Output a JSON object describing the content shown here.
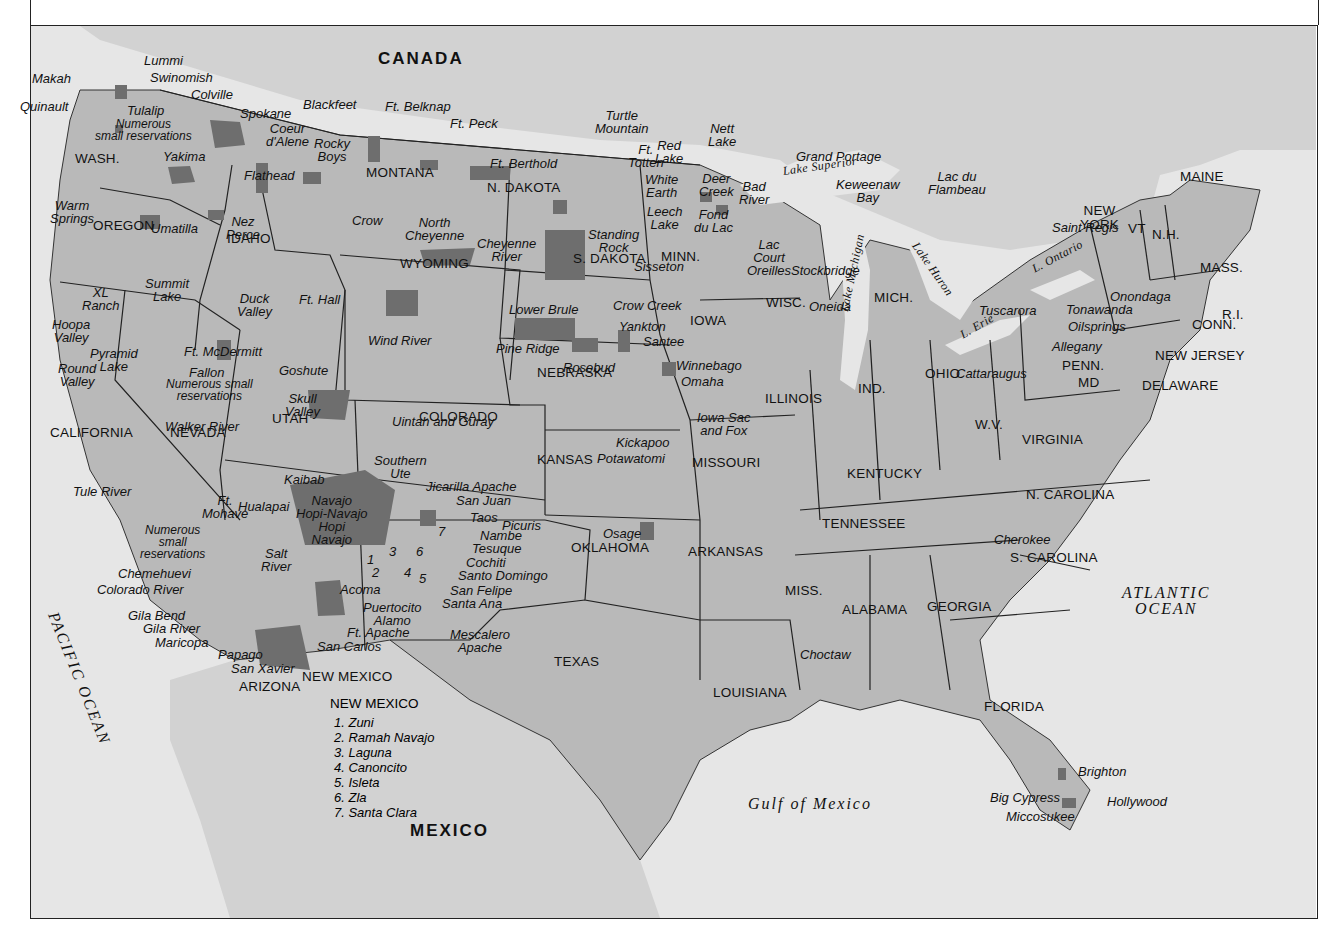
{
  "map": {
    "title": "Indian Reservations of the United States",
    "colors": {
      "water": "#e6e6e6",
      "land_us": "#b9b9b9",
      "land_foreign": "#d2d2d2",
      "reservation": "#6e6e6e",
      "border": "#222222"
    },
    "countries": [
      {
        "id": "canada",
        "label": "CANADA",
        "x": 378,
        "y": 50
      },
      {
        "id": "mexico",
        "label": "MEXICO",
        "x": 410,
        "y": 822
      }
    ],
    "oceans": [
      {
        "id": "pacific",
        "label": "PACIFIC OCEAN",
        "x": 60,
        "y": 610,
        "rotate": 68
      },
      {
        "id": "atlantic",
        "label": "ATLANTIC\nOCEAN",
        "x": 1122,
        "y": 585
      },
      {
        "id": "gulf",
        "label": "Gulf of Mexico",
        "x": 748,
        "y": 796
      }
    ],
    "lakes": [
      {
        "label": "Lake Superior",
        "x": 782,
        "y": 165,
        "rotate": -8
      },
      {
        "label": "Lake Michigan",
        "x": 838,
        "y": 310,
        "rotate": -78
      },
      {
        "label": "Lake Huron",
        "x": 920,
        "y": 240,
        "rotate": 55
      },
      {
        "label": "L. Ontario",
        "x": 1030,
        "y": 264,
        "rotate": -28
      },
      {
        "label": "L. Erie",
        "x": 958,
        "y": 330,
        "rotate": -30
      }
    ],
    "states": [
      {
        "label": "WASH.",
        "x": 75,
        "y": 152
      },
      {
        "label": "OREGON",
        "x": 93,
        "y": 219
      },
      {
        "label": "IDAHO",
        "x": 227,
        "y": 232
      },
      {
        "label": "MONTANA",
        "x": 366,
        "y": 166
      },
      {
        "label": "WYOMING",
        "x": 400,
        "y": 257
      },
      {
        "label": "N. DAKOTA",
        "x": 487,
        "y": 181
      },
      {
        "label": "S. DAKOTA",
        "x": 573,
        "y": 252
      },
      {
        "label": "MINN.",
        "x": 661,
        "y": 250
      },
      {
        "label": "WISC.",
        "x": 766,
        "y": 296
      },
      {
        "label": "MICH.",
        "x": 874,
        "y": 291
      },
      {
        "label": "IOWA",
        "x": 690,
        "y": 314
      },
      {
        "label": "NEBRASKA",
        "x": 537,
        "y": 366
      },
      {
        "label": "NEVADA",
        "x": 170,
        "y": 426
      },
      {
        "label": "CALIFORNIA",
        "x": 50,
        "y": 426
      },
      {
        "label": "UTAH",
        "x": 272,
        "y": 412
      },
      {
        "label": "COLORADO",
        "x": 419,
        "y": 410
      },
      {
        "label": "KANSAS",
        "x": 537,
        "y": 453
      },
      {
        "label": "MISSOURI",
        "x": 692,
        "y": 456
      },
      {
        "label": "ILLINOIS",
        "x": 765,
        "y": 392
      },
      {
        "label": "IND.",
        "x": 858,
        "y": 382
      },
      {
        "label": "OHIO",
        "x": 925,
        "y": 367
      },
      {
        "label": "PENN.",
        "x": 1062,
        "y": 359
      },
      {
        "label": "NEW\nYORK",
        "x": 1080,
        "y": 204
      },
      {
        "label": "VT",
        "x": 1128,
        "y": 222
      },
      {
        "label": "N.H.",
        "x": 1152,
        "y": 228
      },
      {
        "label": "MAINE",
        "x": 1180,
        "y": 170
      },
      {
        "label": "MASS.",
        "x": 1200,
        "y": 261
      },
      {
        "label": "R.I.",
        "x": 1222,
        "y": 308
      },
      {
        "label": "CONN.",
        "x": 1192,
        "y": 318
      },
      {
        "label": "NEW JERSEY",
        "x": 1155,
        "y": 349
      },
      {
        "label": "DELAWARE",
        "x": 1142,
        "y": 379
      },
      {
        "label": "MD",
        "x": 1078,
        "y": 376
      },
      {
        "label": "W.V.",
        "x": 975,
        "y": 418
      },
      {
        "label": "VIRGINIA",
        "x": 1022,
        "y": 433
      },
      {
        "label": "KENTUCKY",
        "x": 847,
        "y": 467
      },
      {
        "label": "TENNESSEE",
        "x": 822,
        "y": 517
      },
      {
        "label": "N. CAROLINA",
        "x": 1026,
        "y": 488
      },
      {
        "label": "S. CAROLINA",
        "x": 1010,
        "y": 551
      },
      {
        "label": "OKLAHOMA",
        "x": 571,
        "y": 541
      },
      {
        "label": "ARKANSAS",
        "x": 688,
        "y": 545
      },
      {
        "label": "MISS.",
        "x": 785,
        "y": 584
      },
      {
        "label": "ALABAMA",
        "x": 842,
        "y": 603
      },
      {
        "label": "GEORGIA",
        "x": 927,
        "y": 600
      },
      {
        "label": "TEXAS",
        "x": 554,
        "y": 655
      },
      {
        "label": "LOUISIANA",
        "x": 713,
        "y": 686
      },
      {
        "label": "FLORIDA",
        "x": 984,
        "y": 700
      },
      {
        "label": "ARIZONA",
        "x": 239,
        "y": 680
      },
      {
        "label": "NEW MEXICO",
        "x": 302,
        "y": 670
      }
    ],
    "reservations": [
      {
        "label": "Lummi",
        "x": 144,
        "y": 54
      },
      {
        "label": "Makah",
        "x": 32,
        "y": 72
      },
      {
        "label": "Swinomish",
        "x": 150,
        "y": 71
      },
      {
        "label": "Quinault",
        "x": 20,
        "y": 100
      },
      {
        "label": "Colville",
        "x": 191,
        "y": 88
      },
      {
        "label": "Tulalip",
        "x": 127,
        "y": 104
      },
      {
        "label": "Numerous\nsmall reservations",
        "x": 95,
        "y": 118,
        "small": true
      },
      {
        "label": "Spokane",
        "x": 240,
        "y": 107
      },
      {
        "label": "Coeur\nd'Alene",
        "x": 266,
        "y": 122
      },
      {
        "label": "Yakima",
        "x": 163,
        "y": 150
      },
      {
        "label": "Blackfeet",
        "x": 303,
        "y": 98
      },
      {
        "label": "Ft. Belknap",
        "x": 385,
        "y": 100
      },
      {
        "label": "Ft. Peck",
        "x": 450,
        "y": 117
      },
      {
        "label": "Rocky\nBoys",
        "x": 314,
        "y": 137
      },
      {
        "label": "Flathead",
        "x": 244,
        "y": 169
      },
      {
        "label": "Warm\nSprings",
        "x": 50,
        "y": 199
      },
      {
        "label": "Umatilla",
        "x": 151,
        "y": 222
      },
      {
        "label": "Nez\nPerce",
        "x": 226,
        "y": 215
      },
      {
        "label": "North\nCheyenne",
        "x": 405,
        "y": 216
      },
      {
        "label": "Crow",
        "x": 352,
        "y": 214
      },
      {
        "label": "Cheyenne\nRiver",
        "x": 477,
        "y": 237
      },
      {
        "label": "Turtle\nMountain",
        "x": 595,
        "y": 109
      },
      {
        "label": "Ft. Berthold",
        "x": 490,
        "y": 157
      },
      {
        "label": "Ft.\nTotten",
        "x": 628,
        "y": 143
      },
      {
        "label": "Red\nLake",
        "x": 655,
        "y": 139
      },
      {
        "label": "Nett\nLake",
        "x": 708,
        "y": 122
      },
      {
        "label": "White\nEarth",
        "x": 645,
        "y": 173
      },
      {
        "label": "Standing\nRock",
        "x": 588,
        "y": 228
      },
      {
        "label": "Sisseton",
        "x": 634,
        "y": 260
      },
      {
        "label": "Leech\nLake",
        "x": 647,
        "y": 205
      },
      {
        "label": "Deer\nCreek",
        "x": 699,
        "y": 172
      },
      {
        "label": "Fond\ndu Lac",
        "x": 694,
        "y": 208
      },
      {
        "label": "Bad\nRiver",
        "x": 739,
        "y": 180
      },
      {
        "label": "Grand Portage",
        "x": 796,
        "y": 150
      },
      {
        "label": "Keweenaw\nBay",
        "x": 836,
        "y": 178
      },
      {
        "label": "Lac du\nFlambeau",
        "x": 928,
        "y": 170
      },
      {
        "label": "Lac\nCourt\nOreilles",
        "x": 747,
        "y": 238
      },
      {
        "label": "Stockbridge",
        "x": 791,
        "y": 264
      },
      {
        "label": "Oneida",
        "x": 809,
        "y": 300
      },
      {
        "label": "Saint Regis",
        "x": 1052,
        "y": 221
      },
      {
        "label": "Tuscarora",
        "x": 979,
        "y": 304
      },
      {
        "label": "Onondaga",
        "x": 1110,
        "y": 290
      },
      {
        "label": "Tonawanda",
        "x": 1066,
        "y": 303
      },
      {
        "label": "Oilsprings",
        "x": 1068,
        "y": 320
      },
      {
        "label": "Allegany",
        "x": 1052,
        "y": 340
      },
      {
        "label": "Cattaraugus",
        "x": 956,
        "y": 367
      },
      {
        "label": "XL\nRanch",
        "x": 82,
        "y": 286
      },
      {
        "label": "Summit\nLake",
        "x": 145,
        "y": 277
      },
      {
        "label": "Duck\nValley",
        "x": 237,
        "y": 292
      },
      {
        "label": "Ft. Hall",
        "x": 299,
        "y": 293
      },
      {
        "label": "Hoopa\nValley",
        "x": 52,
        "y": 318
      },
      {
        "label": "Pyramid\nLake",
        "x": 90,
        "y": 347
      },
      {
        "label": "Ft. McDermitt",
        "x": 184,
        "y": 345
      },
      {
        "label": "Round\nValley",
        "x": 58,
        "y": 362
      },
      {
        "label": "Fallon",
        "x": 189,
        "y": 366
      },
      {
        "label": "Numerous small\nreservations",
        "x": 166,
        "y": 378,
        "small": true
      },
      {
        "label": "Goshute",
        "x": 279,
        "y": 364
      },
      {
        "label": "Skull\nValley",
        "x": 285,
        "y": 392
      },
      {
        "label": "Walker River",
        "x": 165,
        "y": 420
      },
      {
        "label": "Uintah and Guray",
        "x": 392,
        "y": 415
      },
      {
        "label": "Wind River",
        "x": 368,
        "y": 334
      },
      {
        "label": "Lower Brule",
        "x": 509,
        "y": 303
      },
      {
        "label": "Crow Creek",
        "x": 613,
        "y": 299
      },
      {
        "label": "Yankton",
        "x": 619,
        "y": 320
      },
      {
        "label": "Pine Ridge",
        "x": 496,
        "y": 342
      },
      {
        "label": "Santee",
        "x": 643,
        "y": 335
      },
      {
        "label": "Rosebud",
        "x": 563,
        "y": 361
      },
      {
        "label": "Winnebago",
        "x": 676,
        "y": 359
      },
      {
        "label": "Omaha",
        "x": 681,
        "y": 375
      },
      {
        "label": "Iowa Sac\nand Fox",
        "x": 697,
        "y": 411
      },
      {
        "label": "Kickapoo",
        "x": 616,
        "y": 436
      },
      {
        "label": "Potawatomi",
        "x": 597,
        "y": 452
      },
      {
        "label": "Tule River",
        "x": 73,
        "y": 485
      },
      {
        "label": "Kaibab",
        "x": 284,
        "y": 473
      },
      {
        "label": "Southern\nUte",
        "x": 374,
        "y": 454
      },
      {
        "label": "Jicarilla Apache",
        "x": 426,
        "y": 480
      },
      {
        "label": "San Juan",
        "x": 456,
        "y": 494
      },
      {
        "label": "Taos",
        "x": 470,
        "y": 511
      },
      {
        "label": "Picuris",
        "x": 502,
        "y": 519
      },
      {
        "label": "Nambe",
        "x": 480,
        "y": 529
      },
      {
        "label": "Tesuque",
        "x": 472,
        "y": 542
      },
      {
        "label": "Cochiti",
        "x": 466,
        "y": 556
      },
      {
        "label": "Santo Domingo",
        "x": 458,
        "y": 569
      },
      {
        "label": "San Felipe",
        "x": 450,
        "y": 584
      },
      {
        "label": "Santa Ana",
        "x": 442,
        "y": 597
      },
      {
        "label": "Ft.\nMohave",
        "x": 202,
        "y": 494
      },
      {
        "label": "Hualapai",
        "x": 238,
        "y": 500
      },
      {
        "label": "Navajo\nHopi-Navajo\nHopi\nNavajo",
        "x": 296,
        "y": 494
      },
      {
        "label": "Numerous\nsmall\nreservations",
        "x": 140,
        "y": 524,
        "small": true
      },
      {
        "label": "Chemehuevi",
        "x": 118,
        "y": 567
      },
      {
        "label": "Colorado River",
        "x": 97,
        "y": 583
      },
      {
        "label": "Salt\nRiver",
        "x": 261,
        "y": 547
      },
      {
        "label": "Acoma",
        "x": 340,
        "y": 583
      },
      {
        "label": "Puertocito\nAlamo",
        "x": 363,
        "y": 601
      },
      {
        "label": "Ft. Apache",
        "x": 347,
        "y": 626
      },
      {
        "label": "Gila Bend",
        "x": 128,
        "y": 609
      },
      {
        "label": "Gila River",
        "x": 143,
        "y": 622
      },
      {
        "label": "Maricopa",
        "x": 155,
        "y": 636
      },
      {
        "label": "Papago",
        "x": 218,
        "y": 648
      },
      {
        "label": "San Carlos",
        "x": 317,
        "y": 640
      },
      {
        "label": "San Xavier",
        "x": 231,
        "y": 662
      },
      {
        "label": "Mescalero\nApache",
        "x": 450,
        "y": 628
      },
      {
        "label": "Osage",
        "x": 603,
        "y": 527
      },
      {
        "label": "Choctaw",
        "x": 800,
        "y": 648
      },
      {
        "label": "Cherokee",
        "x": 994,
        "y": 533
      },
      {
        "label": "Brighton",
        "x": 1078,
        "y": 765
      },
      {
        "label": "Big Cypress",
        "x": 990,
        "y": 791
      },
      {
        "label": "Hollywood",
        "x": 1107,
        "y": 795
      },
      {
        "label": "Miccosukee",
        "x": 1006,
        "y": 810
      }
    ],
    "nm_numbers": [
      {
        "n": "1",
        "x": 367,
        "y": 553
      },
      {
        "n": "2",
        "x": 372,
        "y": 566
      },
      {
        "n": "3",
        "x": 389,
        "y": 545
      },
      {
        "n": "4",
        "x": 404,
        "y": 566
      },
      {
        "n": "5",
        "x": 419,
        "y": 572
      },
      {
        "n": "6",
        "x": 416,
        "y": 545
      },
      {
        "n": "7",
        "x": 438,
        "y": 525
      }
    ],
    "legend": {
      "title": "NEW MEXICO",
      "items": [
        "1. Zuni",
        "2. Ramah Navajo",
        "3. Laguna",
        "4. Canoncito",
        "5. Isleta",
        "6. Zla",
        "7. Santa Clara"
      ]
    }
  }
}
